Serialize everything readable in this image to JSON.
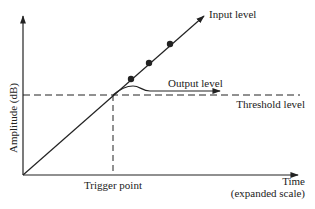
{
  "diagram": {
    "labels": {
      "input_level": "Input level",
      "output_level": "Output level",
      "threshold_level": "Threshold level",
      "y_axis": "Amplitude (dB)",
      "trigger_point": "Trigger point",
      "time": "Time",
      "time_scale": "(expanded scale)"
    },
    "colors": {
      "ink": "#222222",
      "background": "#ffffff"
    },
    "markers": {
      "count": 3,
      "shape": "filled-circle"
    }
  }
}
